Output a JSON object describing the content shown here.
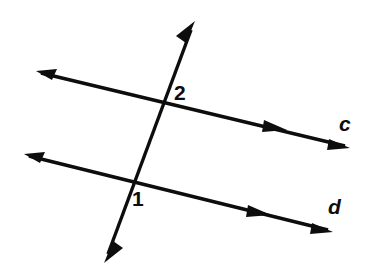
{
  "figure": {
    "width": 375,
    "height": 274,
    "background_color": "#ffffff",
    "stroke_color": "#0d0d0d"
  },
  "labels": {
    "angle_1": "1",
    "angle_2": "2",
    "line_c": "c",
    "line_d": "d"
  },
  "geometry": {
    "lines": [
      {
        "name": "line-c",
        "label": "c",
        "type": "double-arrow-line",
        "start": [
          38,
          72
        ],
        "end": [
          348,
          147
        ],
        "arrow_start": true,
        "arrow_end": true,
        "mid_arrow_at": [
          283,
          129
        ]
      },
      {
        "name": "line-d",
        "label": "d",
        "type": "double-arrow-line",
        "start": [
          26,
          155
        ],
        "end": [
          331,
          231
        ],
        "arrow_start": true,
        "arrow_end": true,
        "mid_arrow_at": [
          267,
          214
        ]
      },
      {
        "name": "transversal",
        "label": "",
        "type": "double-arrow-line",
        "start": [
          194,
          22
        ],
        "end": [
          105,
          262
        ],
        "arrow_start": true,
        "arrow_end": true,
        "mid_arrow_at": null
      }
    ],
    "intersections": [
      {
        "name": "intersection-2",
        "label": "2",
        "point": [
          166,
          103
        ]
      },
      {
        "name": "intersection-1",
        "label": "1",
        "point": [
          133,
          183
        ]
      }
    ]
  }
}
